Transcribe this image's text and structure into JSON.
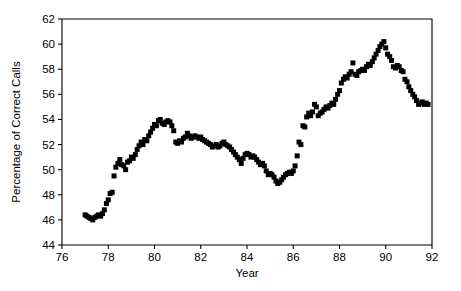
{
  "chart_data": {
    "type": "scatter",
    "title": "",
    "subtitle": "",
    "xlabel": "Year",
    "ylabel": "Percentage of Correct Calls",
    "xlim": [
      76,
      92
    ],
    "ylim": [
      44,
      62
    ],
    "xticks": [
      76,
      78,
      80,
      82,
      84,
      86,
      88,
      90,
      92
    ],
    "xtick_labels": [
      "76",
      "78",
      "80",
      "82",
      "84",
      "86",
      "88",
      "90",
      "92"
    ],
    "yticks": [
      44,
      46,
      48,
      50,
      52,
      54,
      56,
      58,
      60,
      62
    ],
    "ytick_labels": [
      "44",
      "46",
      "48",
      "50",
      "52",
      "54",
      "56",
      "58",
      "60",
      "62"
    ],
    "grid": false,
    "legend": null,
    "marker": {
      "shape": "square",
      "color": "#000000",
      "size": 5
    },
    "series": [
      {
        "name": "Percentage of Correct Calls",
        "x": [
          77.0,
          77.08,
          77.17,
          77.25,
          77.33,
          77.42,
          77.5,
          77.58,
          77.67,
          77.75,
          77.83,
          77.92,
          78.0,
          78.08,
          78.17,
          78.25,
          78.33,
          78.42,
          78.5,
          78.58,
          78.67,
          78.75,
          78.83,
          78.92,
          79.0,
          79.08,
          79.17,
          79.25,
          79.33,
          79.42,
          79.5,
          79.58,
          79.67,
          79.75,
          79.83,
          79.92,
          80.0,
          80.08,
          80.17,
          80.25,
          80.33,
          80.42,
          80.5,
          80.58,
          80.67,
          80.75,
          80.83,
          80.92,
          81.0,
          81.08,
          81.17,
          81.25,
          81.33,
          81.42,
          81.5,
          81.58,
          81.67,
          81.75,
          81.83,
          81.92,
          82.0,
          82.08,
          82.17,
          82.25,
          82.33,
          82.42,
          82.5,
          82.58,
          82.67,
          82.75,
          82.83,
          82.92,
          83.0,
          83.08,
          83.17,
          83.25,
          83.33,
          83.42,
          83.5,
          83.58,
          83.67,
          83.75,
          83.83,
          83.92,
          84.0,
          84.08,
          84.17,
          84.25,
          84.33,
          84.42,
          84.5,
          84.58,
          84.67,
          84.75,
          84.83,
          84.92,
          85.0,
          85.08,
          85.17,
          85.25,
          85.33,
          85.42,
          85.5,
          85.58,
          85.67,
          85.75,
          85.83,
          85.92,
          86.0,
          86.08,
          86.17,
          86.25,
          86.33,
          86.42,
          86.5,
          86.58,
          86.67,
          86.75,
          86.83,
          86.92,
          87.0,
          87.08,
          87.17,
          87.25,
          87.33,
          87.42,
          87.5,
          87.58,
          87.67,
          87.75,
          87.83,
          87.92,
          88.0,
          88.08,
          88.17,
          88.25,
          88.33,
          88.42,
          88.5,
          88.58,
          88.67,
          88.75,
          88.83,
          88.92,
          89.0,
          89.08,
          89.17,
          89.25,
          89.33,
          89.42,
          89.5,
          89.58,
          89.67,
          89.75,
          89.83,
          89.92,
          90.0,
          90.08,
          90.17,
          90.25,
          90.33,
          90.42,
          90.5,
          90.58,
          90.67,
          90.75,
          90.83,
          90.92,
          91.0,
          91.08,
          91.17,
          91.25,
          91.33,
          91.42,
          91.5,
          91.58,
          91.67,
          91.75,
          91.83
        ],
        "y": [
          46.4,
          46.3,
          46.2,
          46.1,
          46.0,
          46.2,
          46.3,
          46.4,
          46.3,
          46.5,
          46.8,
          47.3,
          47.6,
          48.1,
          48.2,
          49.5,
          50.2,
          50.5,
          50.8,
          50.4,
          50.3,
          50.0,
          50.6,
          50.7,
          51.0,
          50.9,
          51.2,
          51.6,
          51.9,
          52.2,
          52.0,
          52.4,
          52.3,
          52.7,
          53.0,
          53.3,
          53.6,
          53.5,
          53.9,
          54.0,
          53.7,
          53.6,
          53.8,
          53.9,
          53.8,
          53.5,
          53.1,
          52.2,
          52.1,
          52.3,
          52.2,
          52.5,
          52.6,
          52.9,
          52.7,
          52.5,
          52.6,
          52.7,
          52.6,
          52.5,
          52.6,
          52.4,
          52.3,
          52.2,
          52.1,
          52.0,
          51.8,
          51.9,
          52.0,
          51.8,
          51.9,
          52.1,
          52.2,
          52.0,
          51.9,
          51.8,
          51.6,
          51.4,
          51.2,
          51.0,
          50.8,
          50.5,
          50.9,
          51.2,
          51.3,
          51.2,
          51.0,
          51.1,
          51.0,
          50.8,
          50.6,
          50.4,
          50.5,
          50.3,
          49.9,
          49.6,
          49.7,
          49.6,
          49.4,
          49.1,
          48.9,
          49.0,
          49.2,
          49.4,
          49.6,
          49.7,
          49.8,
          49.7,
          49.9,
          50.3,
          51.1,
          52.2,
          52.0,
          53.5,
          53.4,
          54.2,
          54.5,
          54.3,
          54.6,
          55.2,
          55.0,
          54.3,
          54.5,
          54.6,
          54.8,
          55.0,
          54.9,
          55.1,
          55.3,
          55.2,
          55.6,
          56.0,
          56.3,
          56.9,
          57.2,
          57.4,
          57.3,
          57.6,
          57.8,
          58.5,
          57.6,
          57.5,
          57.8,
          57.9,
          58.0,
          57.9,
          58.2,
          58.4,
          58.3,
          58.6,
          58.9,
          59.2,
          59.5,
          59.8,
          60.0,
          60.2,
          59.7,
          59.2,
          59.0,
          58.7,
          58.2,
          58.1,
          58.3,
          58.2,
          57.9,
          57.8,
          57.2,
          57.0,
          56.6,
          56.3,
          56.0,
          55.8,
          55.5,
          55.2,
          55.3,
          55.4,
          55.2,
          55.3,
          55.2
        ]
      }
    ]
  }
}
